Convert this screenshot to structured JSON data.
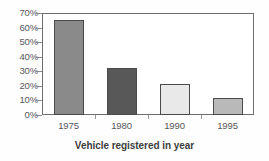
{
  "chart_data": {
    "type": "bar",
    "title": "Vehicle registered in year",
    "xlabel": "Vehicle registered in year",
    "ylabel": "",
    "categories": [
      "1975",
      "1980",
      "1990",
      "1995"
    ],
    "values": [
      65,
      32,
      21,
      12
    ],
    "value_unit": "%",
    "ylim": [
      0,
      70
    ],
    "ytick_labels": [
      "70%",
      "60%",
      "50%",
      "40%",
      "30%",
      "20%",
      "10%",
      "0%"
    ],
    "ytick_values": [
      70,
      60,
      50,
      40,
      30,
      20,
      10,
      0
    ],
    "grid": false,
    "legend": "none",
    "bar_colors": [
      "#8a8a8a",
      "#585858",
      "#e9e9e9",
      "#b9b9b9"
    ],
    "bar_border_color": "#4a4a4c",
    "axis_color": "#6e6e70",
    "background_color": "#fefefe",
    "series": [
      {
        "name": "Share of vehicles",
        "points": [
          {
            "category": "1975",
            "value": 65,
            "label": "65%",
            "color": "#8a8a8a"
          },
          {
            "category": "1980",
            "value": 32,
            "label": "32%",
            "color": "#585858"
          },
          {
            "category": "1990",
            "value": 21,
            "label": "21%",
            "color": "#e9e9e9"
          },
          {
            "category": "1995",
            "value": 12,
            "label": "12%",
            "color": "#b9b9b9"
          }
        ]
      }
    ]
  }
}
